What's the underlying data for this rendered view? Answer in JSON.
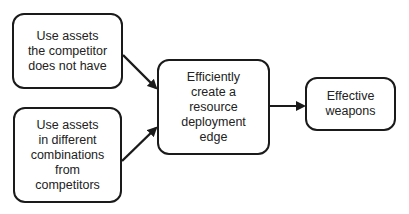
{
  "diagram": {
    "type": "flowchart",
    "nodes": [
      {
        "id": "n1",
        "label": "Use assets\nthe competitor\ndoes not have"
      },
      {
        "id": "n2",
        "label": "Use   assets\nin different\ncombinations\nfrom\ncompetitors"
      },
      {
        "id": "n3",
        "label": "Efficiently\ncreate a\nresource\ndeployment\nedge"
      },
      {
        "id": "n4",
        "label": "Effective\nweapons"
      }
    ],
    "edges": [
      {
        "from": "n1",
        "to": "n3"
      },
      {
        "from": "n2",
        "to": "n3"
      },
      {
        "from": "n3",
        "to": "n4"
      }
    ],
    "colors": {
      "stroke": "#1a1a1a",
      "background": "#ffffff",
      "text": "#222222"
    }
  }
}
